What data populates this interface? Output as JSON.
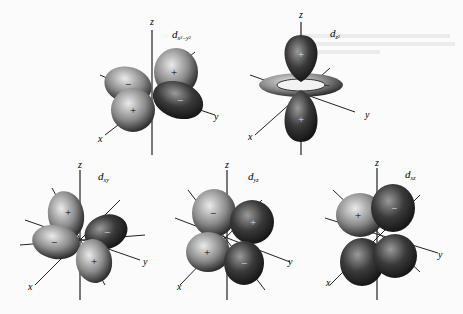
{
  "figure": {
    "orbitals": [
      {
        "id": "dx2-y2",
        "label_main": "d",
        "label_sub": "x²−y²",
        "signs": [
          "+",
          "−",
          "+",
          "−"
        ]
      },
      {
        "id": "dz2",
        "label_main": "d",
        "label_sub": "z²",
        "signs": [
          "+",
          "+",
          "−"
        ]
      },
      {
        "id": "dxy",
        "label_main": "d",
        "label_sub": "xy",
        "signs": [
          "+",
          "−",
          "−",
          "+"
        ]
      },
      {
        "id": "dyz",
        "label_main": "d",
        "label_sub": "yz",
        "signs": [
          "−",
          "+",
          "+",
          "−"
        ]
      },
      {
        "id": "dxz",
        "label_main": "d",
        "label_sub": "xz",
        "signs": [
          "+",
          "−"
        ]
      }
    ],
    "axes": {
      "x": "x",
      "y": "y",
      "z": "z"
    }
  }
}
